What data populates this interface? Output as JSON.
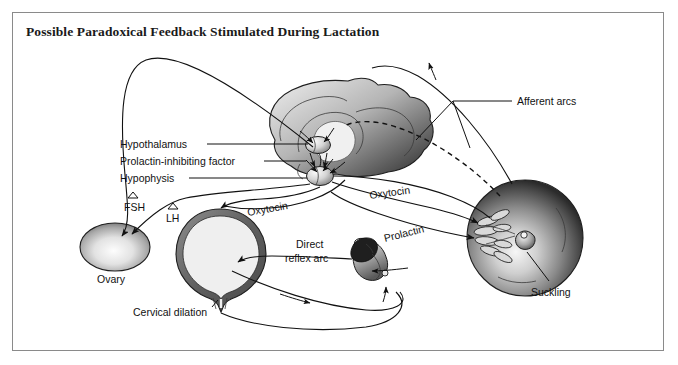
{
  "figure": {
    "title": "Possible Paradoxical Feedback Stimulated During Lactation",
    "background_color": "#ffffff",
    "border_color": "#8a8a8a",
    "ink_color": "#111111"
  },
  "labels": {
    "hypothalamus": "Hypothalamus",
    "prolactin_inhibiting_factor": "Prolactin-inhibiting factor",
    "hypophysis": "Hypophysis",
    "fsh": "FSH",
    "lh": "LH",
    "ovary": "Ovary",
    "cervical_dilation": "Cervical dilation",
    "oxytocin_uterus": "Oxytocin",
    "oxytocin_breast": "Oxytocin",
    "prolactin": "Prolactin",
    "direct_reflex_arc_line1": "Direct",
    "direct_reflex_arc_line2": "reflex arc",
    "afferent_arcs": "Afferent arcs",
    "suckling": "Suckling"
  },
  "icons": {
    "increase_fsh": "up-triangle-icon",
    "increase_lh": "up-triangle-icon"
  },
  "anatomy": [
    {
      "name": "brain-sagittal",
      "label": null
    },
    {
      "name": "hypothalamus-nucleus",
      "label": "Hypothalamus"
    },
    {
      "name": "hypophysis-gland",
      "label": "Hypophysis"
    },
    {
      "name": "ovary",
      "label": "Ovary"
    },
    {
      "name": "uterus",
      "label": "Cervical dilation"
    },
    {
      "name": "infant-head",
      "label": null
    },
    {
      "name": "breast",
      "label": "Suckling"
    }
  ],
  "pathways": [
    {
      "name": "afferent-arc-solid",
      "style": "solid",
      "label": "Afferent arcs"
    },
    {
      "name": "afferent-arc-dashed",
      "style": "dashed",
      "label": "Afferent arcs"
    },
    {
      "name": "oxytocin-to-uterus",
      "style": "solid",
      "label": "Oxytocin"
    },
    {
      "name": "oxytocin-to-breast",
      "style": "solid",
      "label": "Oxytocin"
    },
    {
      "name": "prolactin-to-breast",
      "style": "solid",
      "label": "Prolactin"
    },
    {
      "name": "fsh-to-ovary",
      "style": "solid",
      "label": "FSH"
    },
    {
      "name": "lh-to-ovary",
      "style": "solid",
      "label": "LH"
    },
    {
      "name": "direct-reflex-arc",
      "style": "solid",
      "label": "Direct reflex arc"
    }
  ]
}
